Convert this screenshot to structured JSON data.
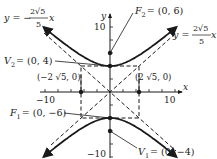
{
  "figure": {
    "type": "hyperbola",
    "equation_form": "y^2/a^2 - x^2/b^2 = 1",
    "center": [
      0,
      0
    ],
    "a": 4,
    "b_label": "2√5",
    "b_value": 4.4721,
    "axes": {
      "x_label": "x",
      "y_label": "y",
      "x_ticks": {
        "neg": "−10",
        "pos": "10"
      },
      "y_ticks": {
        "pos": "10",
        "neg": "−10"
      },
      "range": [
        -10,
        10
      ]
    },
    "points": {
      "F2": {
        "name": "F",
        "sub": "2",
        "text": "= (0, 6)",
        "x": 0,
        "y": 6
      },
      "V2": {
        "name": "V",
        "sub": "2",
        "text": "= (0, 4)",
        "x": 0,
        "y": 4
      },
      "V1": {
        "name": "V",
        "sub": "1",
        "text": "= (0, −4)",
        "x": 0,
        "y": -4
      },
      "F1": {
        "name": "F",
        "sub": "1",
        "text": "= (0, −6)",
        "x": 0,
        "y": -6
      },
      "left": {
        "text": "(−2 √5, 0)",
        "x": -4.4721,
        "y": 0
      },
      "right": {
        "text": "(2 √5, 0)",
        "x": 4.4721,
        "y": 0
      }
    },
    "asymptotes": {
      "negative": {
        "prefix": "y = −",
        "num": "2√5",
        "den": "5",
        "var": "x"
      },
      "positive": {
        "prefix": "y = ",
        "num": "2√5",
        "den": "5",
        "var": "x"
      }
    },
    "colors": {
      "ink": "#1a1a1a",
      "background": "#ffffff"
    }
  }
}
